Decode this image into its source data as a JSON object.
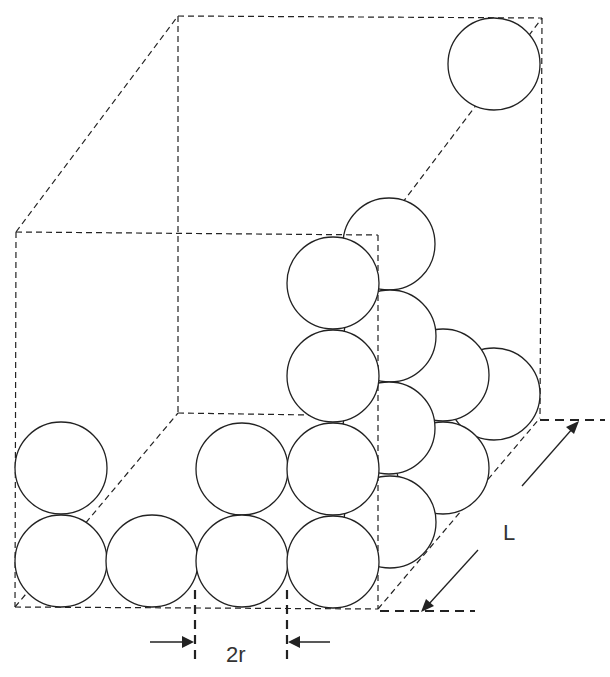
{
  "diagram": {
    "labels": {
      "diameter": "2r",
      "length": "L"
    },
    "colors": {
      "stroke": "#222222",
      "background": "#ffffff"
    },
    "box": {
      "front_face": [
        [
          16,
          232
        ],
        [
          378,
          235
        ],
        [
          378,
          609
        ],
        [
          15,
          607
        ]
      ],
      "back_face": [
        [
          178,
          16
        ],
        [
          542,
          18
        ],
        [
          540,
          418
        ],
        [
          178,
          413
        ]
      ]
    },
    "sphere_radius": 45,
    "spheres_front_face": [
      {
        "cx": 61,
        "cy": 561
      },
      {
        "cx": 152,
        "cy": 561
      },
      {
        "cx": 242,
        "cy": 561
      },
      {
        "cx": 333,
        "cy": 562
      },
      {
        "cx": 61,
        "cy": 468
      },
      {
        "cx": 242,
        "cy": 469
      },
      {
        "cx": 333,
        "cy": 469
      },
      {
        "cx": 333,
        "cy": 376
      },
      {
        "cx": 333,
        "cy": 283
      }
    ],
    "spheres_side_face": [
      {
        "cx": 390,
        "cy": 522
      },
      {
        "cx": 443,
        "cy": 468
      },
      {
        "cx": 494,
        "cy": 394
      },
      {
        "cx": 389,
        "cy": 428
      },
      {
        "cx": 443,
        "cy": 375
      },
      {
        "cx": 390,
        "cy": 336
      },
      {
        "cx": 389,
        "cy": 244
      },
      {
        "cx": 494,
        "cy": 64
      }
    ]
  }
}
